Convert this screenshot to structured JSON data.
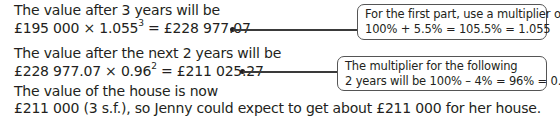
{
  "working": {
    "step1": {
      "line1": "The value after 3 years will be",
      "line2_base": "£195 000 × 1.055",
      "line2_exp": "3",
      "line2_result": " = £228 977.07"
    },
    "step2": {
      "line1": "The value after the next 2 years will be",
      "line2_base": "£228 977.07 × 0.96",
      "line2_exp": "2",
      "line2_result": " = £211 025.27"
    },
    "conclusion": {
      "line1": "The value of the house is now",
      "line2": "£211 000 (3 s.f.), so Jenny could expect to get about £211 000 for her house."
    }
  },
  "notes": [
    {
      "line1": "For the first part, use a multiplier of",
      "line2": "100% + 5.5% = 105.5% = 1.055"
    },
    {
      "line1": "The multiplier for the following",
      "line2": "2 years will be 100% – 4% = 96% = 0.96"
    }
  ],
  "colors": {
    "text": "#231f20",
    "box_border": "#555555",
    "connector": "#3a3a3a"
  }
}
